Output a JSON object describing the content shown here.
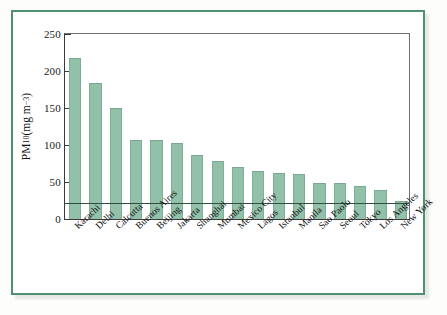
{
  "figure": {
    "frame_color": "#4e9070",
    "bar_color": "#92c0a9",
    "axis_color": "#3b3b3b",
    "reference_line_color": "#2f4f40"
  },
  "axis": {
    "y_title_main": "PM",
    "y_title_sub": "10",
    "y_title_unit_open": " (mg m",
    "y_title_unit_sup": "−3",
    "y_title_unit_close": ")",
    "y_ticks": [
      "0",
      "50",
      "100",
      "150",
      "200",
      "250"
    ]
  },
  "chart_data": {
    "type": "bar",
    "title": "",
    "xlabel": "",
    "ylabel": "PM10 (mg m-3)",
    "ylim": [
      0,
      250
    ],
    "yticks": [
      0,
      50,
      100,
      150,
      200,
      250
    ],
    "grid": false,
    "legend": "none",
    "reference_line": {
      "value": 20,
      "label": ""
    },
    "categories": [
      "Karachi",
      "Delhi",
      "Calcutta",
      "Buenos Aires",
      "Beijing",
      "Jakarta",
      "Shanghai",
      "Mumbai",
      "Mexico City",
      "Lagos",
      "Istanbul",
      "Manila",
      "Sao Paolo",
      "Seoul",
      "Tokyo",
      "Los Angeles",
      "New York"
    ],
    "values": [
      217,
      184,
      150,
      107,
      107,
      103,
      86,
      79,
      70,
      65,
      62,
      61,
      48,
      48,
      44,
      39,
      25
    ]
  }
}
